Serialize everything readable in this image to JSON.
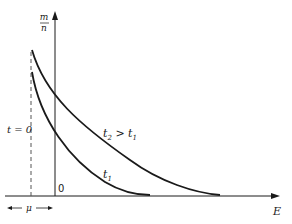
{
  "figure": {
    "y_axis_label_num": "m",
    "y_axis_label_den": "n",
    "x_axis_label": "E",
    "origin_label": "0",
    "dashed_label": "t = 0",
    "offset_label": "μ",
    "curves": [
      {
        "name": "t1",
        "label": "t",
        "label_sub": "1",
        "label_suffix": ""
      },
      {
        "name": "t2",
        "label": "t",
        "label_sub": "2",
        "label_rel": " > t",
        "label_rel_sub": "1"
      }
    ],
    "colors": {
      "ink": "#1a1a1a",
      "dashed": "#555555",
      "background": "#ffffff"
    }
  }
}
